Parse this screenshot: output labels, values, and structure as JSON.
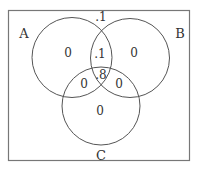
{
  "diagram": {
    "type": "venn-3",
    "colors": {
      "stroke": "#555555",
      "frame": "#777777",
      "text": "#333333",
      "background": "#ffffff"
    },
    "sets": [
      {
        "id": "A",
        "label": "A"
      },
      {
        "id": "B",
        "label": "B"
      },
      {
        "id": "C",
        "label": "C"
      }
    ],
    "regions": {
      "outside": ".1",
      "A_only": "0",
      "B_only": "0",
      "C_only": "0",
      "AB_only": ".1",
      "AC_only": "0",
      "BC_only": "0",
      "ABC": ".8"
    }
  }
}
